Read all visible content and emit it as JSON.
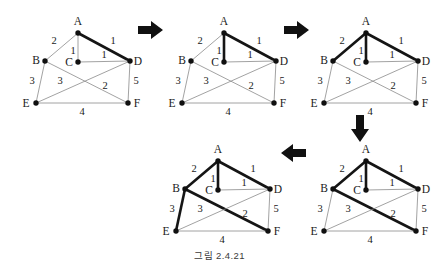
{
  "figure": {
    "caption": "그림 2.4.21",
    "node_labels": {
      "A": "A",
      "B": "B",
      "C": "C",
      "D": "D",
      "E": "E",
      "F": "F"
    },
    "edge_weights": {
      "AB": "2",
      "AC": "1",
      "AD": "1",
      "CD": "1",
      "BE": "3",
      "BF": "2",
      "DE": "3",
      "DF": "5",
      "EF": "4"
    },
    "arrows": {
      "right1": "arrow-right",
      "right2": "arrow-right",
      "down": "arrow-down",
      "left": "arrow-left"
    },
    "steps": [
      {
        "id": "step-1",
        "title": "Step 1",
        "selected_edges": [
          "AD"
        ]
      },
      {
        "id": "step-2",
        "title": "Step 2",
        "selected_edges": [
          "AC",
          "AD"
        ]
      },
      {
        "id": "step-3",
        "title": "Step 3",
        "selected_edges": [
          "AB",
          "AC",
          "AD"
        ]
      },
      {
        "id": "step-4",
        "title": "Step 4",
        "selected_edges": [
          "AB",
          "AC",
          "AD",
          "BF"
        ]
      },
      {
        "id": "step-5",
        "title": "Step 5",
        "selected_edges": [
          "AB",
          "AC",
          "AD",
          "BF",
          "BE"
        ]
      }
    ],
    "colors": {
      "edge": "#8a8a8a",
      "edge_bold": "#151515",
      "node": "#101010",
      "text": "#1a1a1a"
    }
  }
}
